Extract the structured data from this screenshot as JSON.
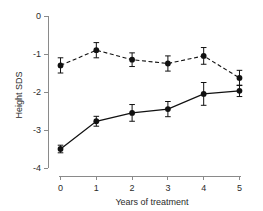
{
  "chart_data": {
    "type": "line",
    "title": "",
    "xlabel": "Years of treatment",
    "ylabel": "Height SDS",
    "x": [
      0,
      1,
      2,
      3,
      4,
      5
    ],
    "xlim": [
      -0.35,
      5.35
    ],
    "ylim": [
      -4,
      0
    ],
    "xticks": [
      0,
      1,
      2,
      3,
      4,
      5
    ],
    "xtick_labels": [
      "0",
      "1",
      "2",
      "3",
      "4",
      "5"
    ],
    "yticks": [
      0,
      -1,
      -2,
      -3,
      -4
    ],
    "ytick_labels": [
      "0",
      "-1",
      "-2",
      "-3",
      "-4"
    ],
    "grid": false,
    "legend": "none",
    "error_type": "error bars",
    "series": [
      {
        "name": "upper-dashed-series",
        "style": "dashed",
        "marker": "filled-circle",
        "values": [
          -1.3,
          -0.9,
          -1.15,
          -1.25,
          -1.05,
          -1.63
        ],
        "errors": [
          0.2,
          0.2,
          0.18,
          0.2,
          0.22,
          0.2
        ]
      },
      {
        "name": "lower-solid-series",
        "style": "solid",
        "marker": "filled-circle",
        "values": [
          -3.5,
          -2.77,
          -2.55,
          -2.45,
          -2.05,
          -1.97
        ],
        "errors": [
          0.1,
          0.13,
          0.22,
          0.2,
          0.3,
          0.15
        ]
      }
    ]
  },
  "axes": {
    "y_axis_title": "Height SDS",
    "x_axis_title": "Years of treatment"
  }
}
